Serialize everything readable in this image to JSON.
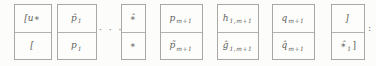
{
  "figure": {
    "description_colors": {
      "background": "#fcfcfb",
      "border": "#aaa8a5",
      "ink": "#5e5d5b"
    }
  },
  "separators": {
    "dots": "· · ·",
    "colon": ":"
  },
  "cells": [
    {
      "top": {
        "main": "[u∗",
        "sub": "",
        "post": ""
      },
      "bottom": {
        "main": "[",
        "sub": "",
        "post": ""
      }
    },
    {
      "top": {
        "main": "p̂",
        "sub": "1",
        "post": ""
      },
      "bottom": {
        "main": "p",
        "sub": "1",
        "post": ""
      }
    },
    {
      "top": {
        "main": "∗̂",
        "sub": "",
        "post": ""
      },
      "bottom": {
        "main": "∗",
        "sub": "",
        "post": ""
      }
    },
    {
      "top": {
        "main": "p",
        "sub": "m+1",
        "post": ""
      },
      "bottom": {
        "main": "p̃",
        "sub": "m+1",
        "post": ""
      }
    },
    {
      "top": {
        "main": "h",
        "sub": "1,m+1",
        "post": ""
      },
      "bottom": {
        "main": "ĝ",
        "sub": "1,m+1",
        "post": ""
      }
    },
    {
      "top": {
        "main": "q",
        "sub": "m+1",
        "post": ""
      },
      "bottom": {
        "main": "q̂",
        "sub": "m+1",
        "post": ""
      }
    },
    {
      "top": {
        "main": "]",
        "sub": "",
        "post": ""
      },
      "bottom": {
        "main": "∗̂",
        "sub": "1",
        "post": "]"
      }
    }
  ]
}
